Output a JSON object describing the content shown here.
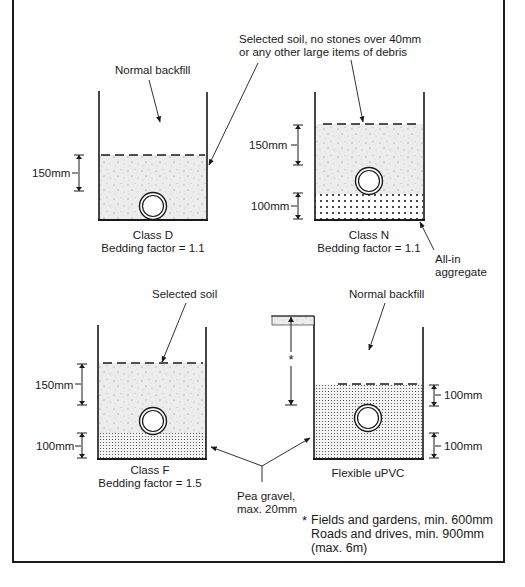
{
  "figure": {
    "colors": {
      "ink": "#1a1a1a",
      "background": "#ffffff",
      "soil_fill": "#e9e9e9"
    }
  },
  "panels": {
    "class_d": {
      "top_label": "Normal backfill",
      "dimension": "150mm",
      "caption_line1": "Class D",
      "caption_line2": "Bedding factor = 1.1"
    },
    "class_n": {
      "top_label_line1": "Selected soil, no stones over 40mm",
      "top_label_line2": "or any other large items of debris",
      "dimension_upper": "150mm",
      "dimension_lower": "100mm",
      "caption_line1": "Class N",
      "caption_line2": "Bedding factor = 1.1",
      "aggregate_label_line1": "All-in",
      "aggregate_label_line2": "aggregate"
    },
    "class_f": {
      "top_label": "Selected soil",
      "dimension_upper": "150mm",
      "dimension_lower": "100mm",
      "caption_line1": "Class F",
      "caption_line2": "Bedding factor = 1.5"
    },
    "flexible_upvc": {
      "top_label": "Normal backfill",
      "depth_marker": "*",
      "dimension_upper": "100mm",
      "dimension_lower": "100mm",
      "caption": "Flexible uPVC"
    }
  },
  "shared": {
    "pea_gravel_line1": "Pea gravel,",
    "pea_gravel_line2": "max. 20mm"
  },
  "footnote": {
    "marker": "*",
    "line1": "Fields and gardens, min. 600mm",
    "line2": "Roads and drives, min. 900mm",
    "line3": "(max. 6m)"
  }
}
